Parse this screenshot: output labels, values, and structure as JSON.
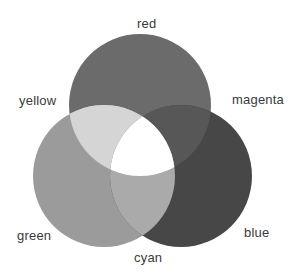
{
  "diagram": {
    "type": "venn",
    "circles": [
      {
        "id": "red",
        "label": "red",
        "cx": 140,
        "cy": 105,
        "r": 71,
        "fill": "#6b6b6b"
      },
      {
        "id": "green",
        "label": "green",
        "cx": 104,
        "cy": 176,
        "r": 71,
        "fill": "#9b9b9b"
      },
      {
        "id": "blue",
        "label": "blue",
        "cx": 181,
        "cy": 176,
        "r": 71,
        "fill": "#474747"
      }
    ],
    "overlaps": {
      "red_green": {
        "label": "yellow",
        "fill": "#d5d5d5"
      },
      "red_blue": {
        "label": "magenta",
        "fill": "#575757"
      },
      "green_blue": {
        "label": "cyan",
        "fill": "#aaaaaa"
      },
      "all": {
        "fill": "#ffffff"
      }
    },
    "labels": {
      "red": "red",
      "yellow": "yellow",
      "magenta": "magenta",
      "green": "green",
      "cyan": "cyan",
      "blue": "blue"
    }
  }
}
